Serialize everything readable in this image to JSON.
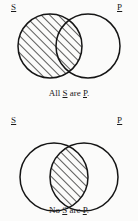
{
  "page": {
    "background_color": "#fbfbfa",
    "ink_color": "#1a1a1a"
  },
  "figures": [
    {
      "id": "all-s-are-p",
      "label_left": "S",
      "label_right": "P",
      "caption_prefix": "All ",
      "caption_subject": "S",
      "caption_middle": " are ",
      "caption_predicate": "P",
      "caption_suffix": ".",
      "caption_full": "All S are P.",
      "shading": "left-circle-entirely-shaded",
      "shading_style": "diagonal-hatch",
      "circles": [
        {
          "name": "S",
          "cx": 50,
          "cy": 46,
          "r": 32
        },
        {
          "name": "P",
          "cx": 88,
          "cy": 46,
          "r": 32
        }
      ]
    },
    {
      "id": "no-s-are-p",
      "label_left": "S",
      "label_right": "P",
      "caption_prefix": "No ",
      "caption_subject": "S",
      "caption_middle": " are ",
      "caption_predicate": "P",
      "caption_suffix": ".",
      "caption_full": "No S are P.",
      "shading": "intersection-shaded",
      "shading_style": "diagonal-hatch",
      "circles": [
        {
          "name": "S",
          "cx": 54,
          "cy": 51,
          "r": 34
        },
        {
          "name": "P",
          "cx": 84,
          "cy": 51,
          "r": 34
        }
      ]
    }
  ]
}
